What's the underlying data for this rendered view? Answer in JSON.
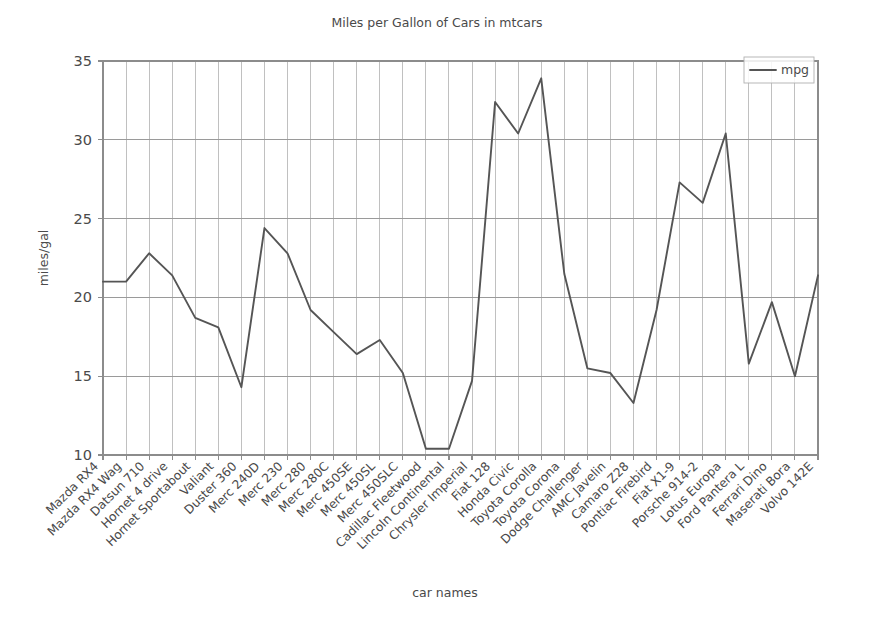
{
  "chart_data": {
    "type": "line",
    "title": "Miles per Gallon of Cars in mtcars",
    "xlabel": "car names",
    "ylabel": "miles/gal",
    "ylim": [
      10,
      35
    ],
    "yticks": [
      10,
      15,
      20,
      25,
      30,
      35
    ],
    "ytick_labels": [
      "10",
      "15",
      "20",
      "25",
      "30",
      "35"
    ],
    "grid": true,
    "legend_position": "upper right",
    "legend": [
      "mpg"
    ],
    "categories": [
      "Mazda RX4",
      "Mazda RX4 Wag",
      "Datsun 710",
      "Hornet 4 drive",
      "Hornet Sportabout",
      "Valiant",
      "Duster 360",
      "Merc 240D",
      "Merc 230",
      "Merc 280",
      "Merc 280C",
      "Merc 450SE",
      "Merc 450SL",
      "Merc 450SLC",
      "Cadillac Fleetwood",
      "Lincoln Continental",
      "Chrysler Imperial",
      "Fiat 128",
      "Honda Civic",
      "Toyota Corolla",
      "Toyota Corona",
      "Dodge Challenger",
      "AMC Javelin",
      "Camaro Z28",
      "Pontiac Firebird",
      "Fiat X1-9",
      "Porsche 914-2",
      "Lotus Europa",
      "Ford Pantera L",
      "Ferrari Dino",
      "Maserati Bora",
      "Volvo 142E"
    ],
    "series": [
      {
        "name": "mpg",
        "color": "#555555",
        "values": [
          21.0,
          21.0,
          22.8,
          21.4,
          18.7,
          18.1,
          14.3,
          24.4,
          22.8,
          19.2,
          17.8,
          16.4,
          17.3,
          15.2,
          10.4,
          10.4,
          14.7,
          32.4,
          30.4,
          33.9,
          21.5,
          15.5,
          15.2,
          13.3,
          19.2,
          27.3,
          26.0,
          30.4,
          15.8,
          19.7,
          15.0,
          21.4
        ]
      }
    ],
    "colors": {
      "line": "#555555",
      "grid": "#b9b9b9",
      "axis": "#8c8c8c",
      "text": "#4a4a4a",
      "background": "#ffffff"
    }
  }
}
